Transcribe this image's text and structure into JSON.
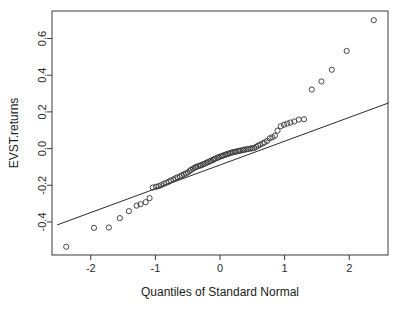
{
  "chart_data": {
    "type": "scatter",
    "title": "",
    "subtitle": "",
    "xlabel": "Quantiles of Standard Normal",
    "ylabel": "EVST.returns",
    "grid": false,
    "legend": "none",
    "xlim": [
      -2.6,
      2.6
    ],
    "ylim": [
      -0.58,
      0.75
    ],
    "xticks": [
      -2,
      -1,
      0,
      1,
      2
    ],
    "xtick_labels": [
      "-2",
      "-1",
      "0",
      "1",
      "2"
    ],
    "yticks": [
      -0.4,
      -0.2,
      0.0,
      0.2,
      0.4,
      0.6
    ],
    "ytick_labels": [
      "-0.4",
      "-0.2",
      "0.0",
      "0.2",
      "0.4",
      "0.6"
    ],
    "annotations": [],
    "reference_line": {
      "name": "qqline",
      "x": [
        -2.52,
        2.61
      ],
      "y": [
        -0.416,
        0.249
      ]
    },
    "series": [
      {
        "name": "EVST.returns sample quantiles",
        "marker": "open-circle",
        "points": [
          [
            -2.38,
            -0.535
          ],
          [
            -1.95,
            -0.432
          ],
          [
            -1.72,
            -0.43
          ],
          [
            -1.55,
            -0.379
          ],
          [
            -1.41,
            -0.341
          ],
          [
            -1.29,
            -0.311
          ],
          [
            -1.23,
            -0.303
          ],
          [
            -1.15,
            -0.292
          ],
          [
            -1.09,
            -0.27
          ],
          [
            -1.04,
            -0.212
          ],
          [
            -0.99,
            -0.208
          ],
          [
            -0.95,
            -0.205
          ],
          [
            -0.91,
            -0.199
          ],
          [
            -0.87,
            -0.192
          ],
          [
            -0.83,
            -0.186
          ],
          [
            -0.79,
            -0.18
          ],
          [
            -0.76,
            -0.173
          ],
          [
            -0.72,
            -0.168
          ],
          [
            -0.69,
            -0.162
          ],
          [
            -0.66,
            -0.157
          ],
          [
            -0.62,
            -0.152
          ],
          [
            -0.59,
            -0.146
          ],
          [
            -0.56,
            -0.141
          ],
          [
            -0.53,
            -0.136
          ],
          [
            -0.5,
            -0.13
          ],
          [
            -0.47,
            -0.122
          ],
          [
            -0.45,
            -0.116
          ],
          [
            -0.42,
            -0.11
          ],
          [
            -0.39,
            -0.104
          ],
          [
            -0.37,
            -0.1
          ],
          [
            -0.34,
            -0.096
          ],
          [
            -0.31,
            -0.093
          ],
          [
            -0.29,
            -0.09
          ],
          [
            -0.26,
            -0.086
          ],
          [
            -0.24,
            -0.082
          ],
          [
            -0.21,
            -0.078
          ],
          [
            -0.19,
            -0.074
          ],
          [
            -0.16,
            -0.07
          ],
          [
            -0.14,
            -0.066
          ],
          [
            -0.11,
            -0.062
          ],
          [
            -0.09,
            -0.058
          ],
          [
            -0.07,
            -0.054
          ],
          [
            -0.04,
            -0.05
          ],
          [
            -0.02,
            -0.046
          ],
          [
            0.01,
            -0.043
          ],
          [
            0.03,
            -0.04
          ],
          [
            0.05,
            -0.037
          ],
          [
            0.08,
            -0.034
          ],
          [
            0.1,
            -0.031
          ],
          [
            0.13,
            -0.028
          ],
          [
            0.15,
            -0.025
          ],
          [
            0.18,
            -0.022
          ],
          [
            0.2,
            -0.02
          ],
          [
            0.23,
            -0.018
          ],
          [
            0.25,
            -0.016
          ],
          [
            0.28,
            -0.014
          ],
          [
            0.3,
            -0.012
          ],
          [
            0.33,
            -0.01
          ],
          [
            0.36,
            -0.008
          ],
          [
            0.38,
            -0.006
          ],
          [
            0.41,
            -0.004
          ],
          [
            0.44,
            -0.002
          ],
          [
            0.47,
            0.0
          ],
          [
            0.5,
            0.002
          ],
          [
            0.53,
            0.004
          ],
          [
            0.56,
            0.01
          ],
          [
            0.59,
            0.016
          ],
          [
            0.62,
            0.022
          ],
          [
            0.66,
            0.028
          ],
          [
            0.69,
            0.034
          ],
          [
            0.73,
            0.042
          ],
          [
            0.77,
            0.056
          ],
          [
            0.81,
            0.062
          ],
          [
            0.85,
            0.07
          ],
          [
            0.89,
            0.098
          ],
          [
            0.94,
            0.122
          ],
          [
            0.99,
            0.13
          ],
          [
            1.04,
            0.136
          ],
          [
            1.09,
            0.142
          ],
          [
            1.15,
            0.148
          ],
          [
            1.22,
            0.158
          ],
          [
            1.3,
            0.16
          ],
          [
            1.42,
            0.322
          ],
          [
            1.57,
            0.366
          ],
          [
            1.73,
            0.43
          ],
          [
            1.96,
            0.532
          ],
          [
            2.38,
            0.7
          ]
        ]
      }
    ]
  },
  "figure": {
    "plot_area": {
      "left": 52,
      "right": 388,
      "top": 11,
      "bottom": 255
    },
    "background_color": "#ffffff",
    "axis_color": "#3a3a3a",
    "point_color": "#333333",
    "line_color": "#2b2b2b"
  }
}
